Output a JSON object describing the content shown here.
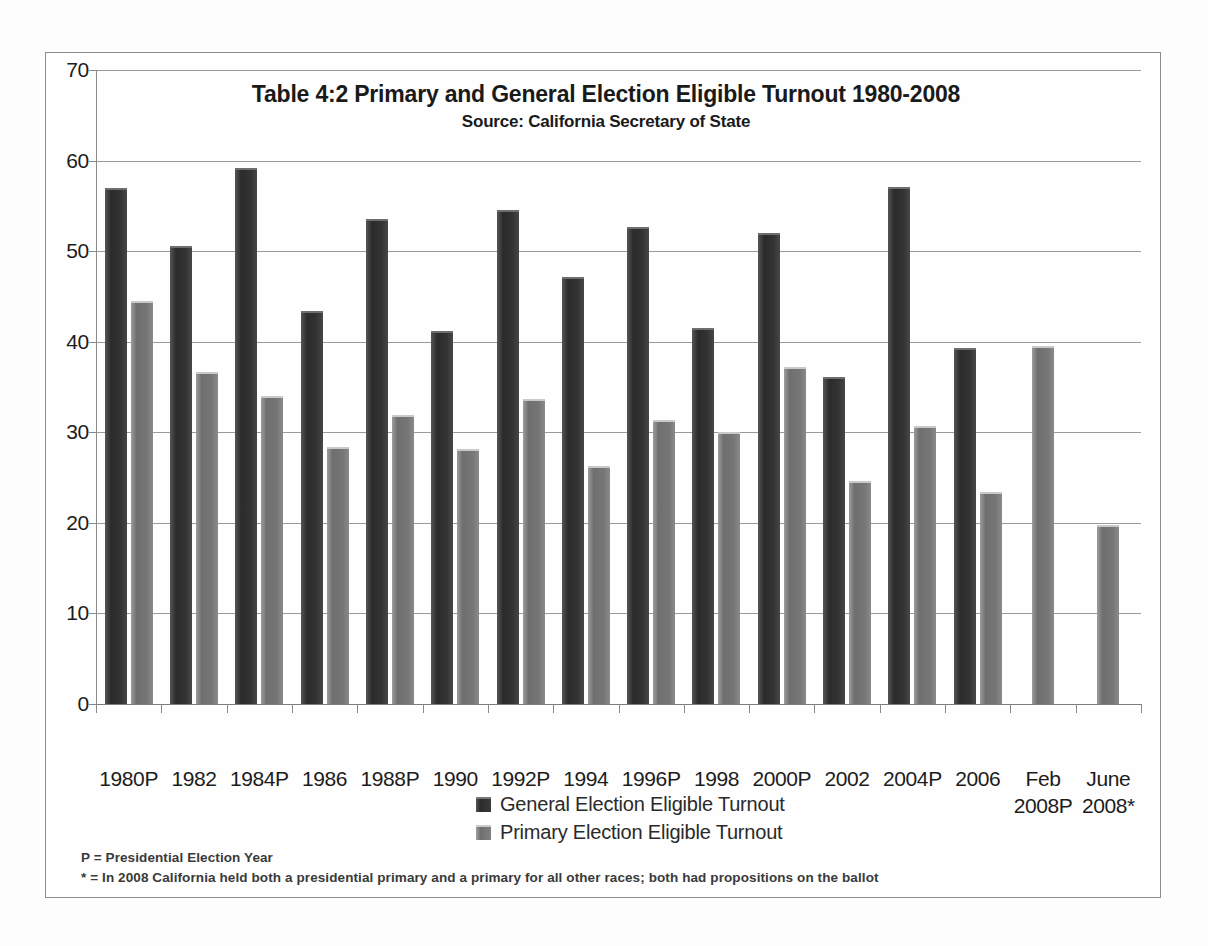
{
  "chart_data": {
    "type": "bar",
    "title": "Table 4:2 Primary and General Election Eligible Turnout 1980-2008",
    "subtitle": "Source: California Secretary of State",
    "xlabel": "",
    "ylabel": "",
    "ylim": [
      0,
      70
    ],
    "ytick_step": 10,
    "yticks": [
      "0",
      "10",
      "20",
      "30",
      "40",
      "50",
      "60",
      "70"
    ],
    "grid": true,
    "legend_position": "bottom-center",
    "categories": [
      "1980P",
      "1982",
      "1984P",
      "1986",
      "1988P",
      "1990",
      "1992P",
      "1994",
      "1996P",
      "1998",
      "2000P",
      "2002",
      "2004P",
      "2006",
      "Feb\n2008P",
      "June\n2008*"
    ],
    "series": [
      {
        "name": "General Election Eligible Turnout",
        "color": "#2e2e2e",
        "values": [
          57.0,
          50.6,
          59.2,
          43.4,
          53.6,
          41.2,
          54.5,
          47.1,
          52.7,
          41.5,
          52.0,
          36.1,
          57.1,
          39.3,
          null,
          null
        ]
      },
      {
        "name": "Primary Election Eligible Turnout",
        "color": "#787878",
        "values": [
          44.5,
          36.7,
          34.0,
          28.4,
          31.9,
          28.2,
          33.7,
          26.3,
          31.4,
          30.0,
          37.2,
          24.6,
          30.7,
          23.4,
          39.5,
          19.8
        ]
      }
    ]
  },
  "footnotes": [
    "P = Presidential Election Year",
    "* =  In  2008  California held  both a presidential primary and a primary for all other races; both had propositions on the ballot"
  ]
}
